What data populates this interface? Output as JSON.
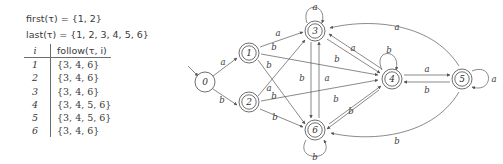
{
  "formulas": {
    "first": "first(τ) = {1, 2}",
    "last": "last(τ) = {1, 2, 3, 4, 5, 6}"
  },
  "table": {
    "headers": [
      "i",
      "follow(τ, i)"
    ],
    "rows": [
      {
        "i": "1",
        "follow": "{3, 4, 6}"
      },
      {
        "i": "2",
        "follow": "{3, 4, 6}"
      },
      {
        "i": "3",
        "follow": "{3, 4, 6}"
      },
      {
        "i": "4",
        "follow": "{3, 4, 5, 6}"
      },
      {
        "i": "5",
        "follow": "{3, 4, 5, 6}"
      },
      {
        "i": "6",
        "follow": "{3, 4, 6}"
      }
    ]
  },
  "automaton": {
    "nodes": [
      {
        "id": "0",
        "label": "0",
        "accepting": false,
        "start": true
      },
      {
        "id": "1",
        "label": "1",
        "accepting": true,
        "start": false
      },
      {
        "id": "2",
        "label": "2",
        "accepting": true,
        "start": false
      },
      {
        "id": "3",
        "label": "3",
        "accepting": true,
        "start": false
      },
      {
        "id": "4",
        "label": "4",
        "accepting": true,
        "start": false
      },
      {
        "id": "5",
        "label": "5",
        "accepting": true,
        "start": false
      },
      {
        "id": "6",
        "label": "6",
        "accepting": true,
        "start": false
      }
    ],
    "edges": [
      {
        "from": "0",
        "to": "1",
        "label": "a"
      },
      {
        "from": "0",
        "to": "2",
        "label": "b"
      },
      {
        "from": "1",
        "to": "3",
        "label": "a"
      },
      {
        "from": "1",
        "to": "4",
        "label": "b"
      },
      {
        "from": "1",
        "to": "6",
        "label": "b"
      },
      {
        "from": "2",
        "to": "3",
        "label": "a"
      },
      {
        "from": "2",
        "to": "4",
        "label": "b"
      },
      {
        "from": "2",
        "to": "6",
        "label": "b"
      },
      {
        "from": "3",
        "to": "3",
        "label": "a"
      },
      {
        "from": "3",
        "to": "4",
        "label": "b"
      },
      {
        "from": "3",
        "to": "6",
        "label": "b"
      },
      {
        "from": "4",
        "to": "3",
        "label": "a"
      },
      {
        "from": "4",
        "to": "4",
        "label": "b"
      },
      {
        "from": "4",
        "to": "5",
        "label": "a"
      },
      {
        "from": "4",
        "to": "6",
        "label": "b"
      },
      {
        "from": "5",
        "to": "3",
        "label": "a"
      },
      {
        "from": "5",
        "to": "4",
        "label": "b"
      },
      {
        "from": "5",
        "to": "5",
        "label": "a"
      },
      {
        "from": "5",
        "to": "6",
        "label": "b"
      },
      {
        "from": "6",
        "to": "3",
        "label": "a"
      },
      {
        "from": "6",
        "to": "4",
        "label": "b"
      },
      {
        "from": "6",
        "to": "6",
        "label": "b"
      }
    ],
    "labels": {
      "e_0_1": "a",
      "e_0_2": "b",
      "e_1_3": "a",
      "e_1_4": "b",
      "e_1_6": "b",
      "e_2_3": "a",
      "e_2_4": "b",
      "e_2_6": "b",
      "loop_3": "a",
      "e_3_6": "b",
      "e_6_3": "a",
      "e_3_4": "b",
      "e_4_3": "a",
      "loop_4": "b",
      "e_6_4": "b",
      "e_4_6": "b",
      "e_4_5": "a",
      "e_5_4": "b",
      "loop_5": "a",
      "e_5_3": "a",
      "e_5_6": "b",
      "loop_6": "b"
    },
    "node_labels": {
      "n0": "0",
      "n1": "1",
      "n2": "2",
      "n3": "3",
      "n4": "4",
      "n5": "5",
      "n6": "6"
    }
  }
}
